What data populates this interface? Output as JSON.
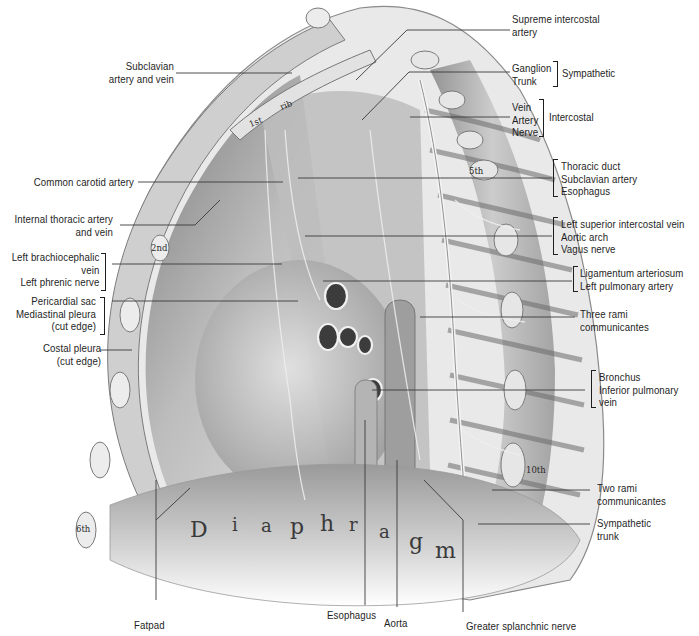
{
  "figure": {
    "in_drawing_text": {
      "rib_first": "1st",
      "rib_word": "rib",
      "rib_second": "2nd",
      "rib_fifth": "5th",
      "rib_sixth": "6th",
      "rib_tenth": "10th",
      "diaphragm_letters": [
        "D",
        "i",
        "a",
        "p",
        "h",
        "r",
        "a",
        "g",
        "m"
      ]
    },
    "left_labels": {
      "subclavian": "Subclavian\nartery and vein",
      "common_carotid": "Common carotid artery",
      "internal_thoracic": "Internal thoracic artery\nand vein",
      "brachiocephalic_group": "Left brachiocephalic\nvein\nLeft phrenic nerve",
      "pericardial_group": "Pericardial sac\nMediastinal pleura\n(cut edge)",
      "costal_pleura": "Costal pleura\n(cut edge)"
    },
    "right_labels": {
      "supreme_intercostal": "Supreme intercostal\nartery",
      "sympathetic_items": "Ganglion\nTrunk",
      "sympathetic_group": "Sympathetic",
      "intercostal_items": "Vein\nArtery\nNerve",
      "intercostal_group": "Intercostal",
      "thoracic_group": "Thoracic duct\nSubclavian artery\nEsophagus",
      "aortic_group": "Left superior intercostal vein\nAortic arch\nVagus nerve",
      "ligamentum_group": "Ligamentum arteriosum\nLeft pulmonary artery",
      "three_rami": "Three rami\ncommunicantes",
      "bronchus_group": "Bronchus\nInferior pulmonary\nvein",
      "two_rami": "Two rami\ncommunicantes",
      "sympathetic_trunk": "Sympathetic\ntrunk"
    },
    "bottom_labels": {
      "fatpad": "Fatpad",
      "esophagus": "Esophagus",
      "aorta": "Aorta",
      "greater_splanchnic": "Greater splanchnic nerve"
    },
    "colors": {
      "background": "#ffffff",
      "label_text": "#1e1e1e",
      "leader_line": "#3a3a3a",
      "tissue_light": "#d9d9d9",
      "tissue_mid": "#a8a8a8",
      "tissue_dark": "#5e5e5e"
    }
  }
}
